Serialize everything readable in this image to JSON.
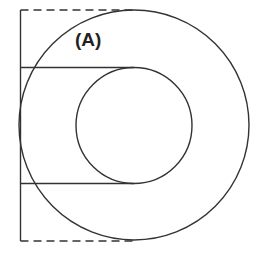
{
  "figure": {
    "label": "(A)",
    "stroke_color": "#333333",
    "background": "#ffffff"
  },
  "shapes": {
    "outer_circle": {
      "cx": 134,
      "cy": 125,
      "r": 115
    },
    "inner_circle": {
      "cx": 134,
      "cy": 125.5,
      "r": 58
    },
    "vertical_line": {
      "x": 20.5,
      "y1": 10,
      "y2": 241
    },
    "upper_tangent_line": {
      "x1": 20.5,
      "x2": 134,
      "y": 67.5
    },
    "lower_tangent_line": {
      "x1": 20.5,
      "x2": 134,
      "y": 183.5
    },
    "top_dashed_line": {
      "x1": 20.5,
      "x2": 134,
      "y": 10
    },
    "bottom_dashed_line": {
      "x1": 20.5,
      "x2": 134,
      "y": 241
    }
  }
}
